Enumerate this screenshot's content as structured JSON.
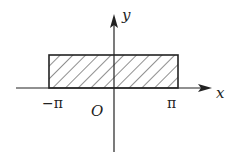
{
  "diagram": {
    "axes": {
      "x_label": "x",
      "y_label": "y",
      "origin_label": "O"
    },
    "ticks": {
      "neg_pi": "−π",
      "pi": "π"
    },
    "region": {
      "x_from": "−π",
      "x_to": "π",
      "fill": "hatched"
    },
    "colors": {
      "stroke": "#222222"
    }
  }
}
